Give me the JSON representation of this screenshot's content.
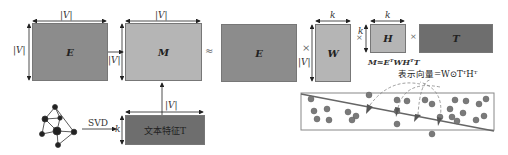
{
  "left": {
    "E_label": "E",
    "M_label": "M",
    "T_label": "文本特征T",
    "dim_V": "|V|",
    "dim_k": "k",
    "svd_label": "SVD"
  },
  "right": {
    "approx": "≈",
    "times": "×",
    "E_label": "E",
    "W_label": "W",
    "H_label": "H",
    "T_label": "T",
    "dim_k": "k",
    "dim_V": "|V|",
    "formula": "M≈EᵀWHᵀT",
    "representation": "表示向量=W⊙TᵀHᵀ"
  },
  "colors": {
    "dark_block": "#8c8c8c",
    "light_block": "#b5b5b5",
    "darkest_block": "#6e6e6e",
    "dot": "#7a7a7a"
  }
}
